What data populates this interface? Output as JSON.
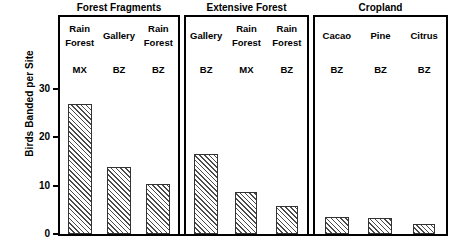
{
  "chart_data": {
    "type": "bar",
    "title": "",
    "xlabel": "",
    "ylabel": "Birds Banded per Site",
    "ylim": [
      0,
      30
    ],
    "yticks": [
      0,
      10,
      20,
      30
    ],
    "ytick_labels": [
      "0",
      "10",
      "20",
      "30"
    ],
    "grid": false,
    "legend": "none",
    "panels": [
      {
        "title": "Forest Fragments",
        "categories": [
          {
            "line1": "Rain",
            "line2": "Forest",
            "code": "MX",
            "label": "Rain Forest MX",
            "value": 26
          },
          {
            "line1": "Gallery",
            "line2": "",
            "code": "BZ",
            "label": "Gallery BZ",
            "value": 13.5
          },
          {
            "line1": "Rain",
            "line2": "Forest",
            "code": "BZ",
            "label": "Rain Forest BZ",
            "value": 10
          }
        ]
      },
      {
        "title": "Extensive Forest",
        "categories": [
          {
            "line1": "Gallery",
            "line2": "",
            "code": "BZ",
            "label": "Gallery BZ",
            "value": 16
          },
          {
            "line1": "Rain",
            "line2": "Forest",
            "code": "MX",
            "label": "Rain Forest MX",
            "value": 8.5
          },
          {
            "line1": "Rain",
            "line2": "Forest",
            "code": "BZ",
            "label": "Rain Forest BZ",
            "value": 5.6
          }
        ]
      },
      {
        "title": "Cropland",
        "categories": [
          {
            "line1": "Cacao",
            "line2": "",
            "code": "BZ",
            "label": "Cacao BZ",
            "value": 3.5
          },
          {
            "line1": "Pine",
            "line2": "",
            "code": "BZ",
            "label": "Pine BZ",
            "value": 3.3
          },
          {
            "line1": "Citrus",
            "line2": "",
            "code": "BZ",
            "label": "Citrus BZ",
            "value": 2.0
          }
        ]
      }
    ]
  }
}
